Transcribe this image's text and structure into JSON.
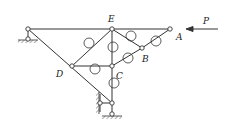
{
  "diagram": {
    "type": "truss-mechanism",
    "labels": {
      "E": "E",
      "A": "A",
      "B": "B",
      "C": "C",
      "D": "D",
      "P": "P"
    },
    "nodes": [
      {
        "id": "top-left-pin",
        "x": 28,
        "y": 29
      },
      {
        "id": "E",
        "x": 112,
        "y": 29
      },
      {
        "id": "A",
        "x": 170,
        "y": 29
      },
      {
        "id": "B",
        "x": 142,
        "y": 48
      },
      {
        "id": "D",
        "x": 72,
        "y": 66
      },
      {
        "id": "C",
        "x": 112,
        "y": 66
      },
      {
        "id": "lower-left",
        "x": 100,
        "y": 103
      },
      {
        "id": "lower-right",
        "x": 112,
        "y": 103
      },
      {
        "id": "bottom-support",
        "x": 112,
        "y": 114
      }
    ],
    "members": [
      [
        "top-left-pin",
        "A"
      ],
      [
        "top-left-pin",
        "lower-right"
      ],
      [
        "E",
        "D"
      ],
      [
        "E",
        "C"
      ],
      [
        "E",
        "B"
      ],
      [
        "B",
        "A"
      ],
      [
        "D",
        "C"
      ],
      [
        "C",
        "B"
      ],
      [
        "C",
        "lower-right"
      ],
      [
        "lower-left",
        "lower-right"
      ]
    ],
    "force": {
      "label": "P",
      "direction": "left"
    },
    "colors": {
      "line": "#333333",
      "background": "#ffffff"
    }
  }
}
